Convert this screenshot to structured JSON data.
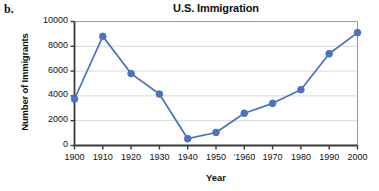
{
  "figure": {
    "label": "b."
  },
  "chart_data": {
    "type": "line",
    "title": "U.S. Immigration",
    "xlabel": "Year",
    "ylabel": "Number of Immigrants",
    "categories": [
      1900,
      1910,
      1920,
      1930,
      1940,
      1950,
      1960,
      1970,
      1980,
      1990,
      2000
    ],
    "values": [
      3750,
      8800,
      5800,
      4150,
      550,
      1050,
      2600,
      3400,
      4500,
      7400,
      9100
    ],
    "xlim": [
      1900,
      2000
    ],
    "ylim": [
      0,
      10000
    ],
    "xticks": [
      1900,
      1910,
      1920,
      1930,
      1940,
      1950,
      1960,
      1970,
      1980,
      1990,
      2000
    ],
    "xtick_labels": [
      "1900",
      "1910",
      "1920",
      "1930",
      "1940",
      "1950",
      "1960",
      "1970",
      "1980",
      "1990",
      "2000"
    ],
    "xtick_prefix_marks": {
      "1960": "'"
    },
    "yticks": [
      0,
      2000,
      4000,
      6000,
      8000,
      10000
    ],
    "ytick_labels": [
      "0",
      "2000",
      "4000",
      "6000",
      "8000",
      "10000"
    ],
    "grid": "horizontal",
    "legend": "none",
    "marker": "circle",
    "series_color": "#4a72c0",
    "grid_color": "#d8d8dc",
    "axis_color": "#3a3a3a",
    "frame_color": "#9a9a9e"
  }
}
